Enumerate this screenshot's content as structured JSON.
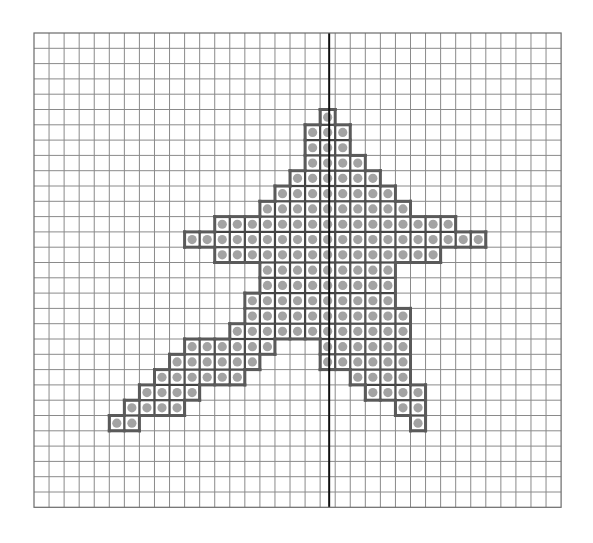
{
  "diagram": {
    "type": "pixel-grid-figure",
    "grid": {
      "columns": 35,
      "rows": 31,
      "origin_x": 34,
      "origin_y": 33,
      "cell_width": 15.06,
      "cell_height": 15.3,
      "line_color": "#8a8a8a",
      "border_color": "#6a6a6a"
    },
    "symmetry_line": {
      "column": 19,
      "position": "center-of-column",
      "color": "#111111",
      "width": 2
    },
    "shape": {
      "outline_color": "#5a5a5a",
      "cell_fill": "#ffffff",
      "dot_color": "#a3a3a3",
      "dot_radius": 4.6,
      "filled_rows": [
        {
          "row": 5,
          "spans": [
            [
              19,
              19
            ]
          ]
        },
        {
          "row": 6,
          "spans": [
            [
              18,
              20
            ]
          ]
        },
        {
          "row": 7,
          "spans": [
            [
              18,
              20
            ]
          ]
        },
        {
          "row": 8,
          "spans": [
            [
              18,
              21
            ]
          ]
        },
        {
          "row": 9,
          "spans": [
            [
              17,
              22
            ]
          ]
        },
        {
          "row": 10,
          "spans": [
            [
              16,
              23
            ]
          ]
        },
        {
          "row": 11,
          "spans": [
            [
              15,
              24
            ]
          ]
        },
        {
          "row": 12,
          "spans": [
            [
              12,
              27
            ]
          ]
        },
        {
          "row": 13,
          "spans": [
            [
              10,
              29
            ]
          ]
        },
        {
          "row": 14,
          "spans": [
            [
              12,
              26
            ]
          ]
        },
        {
          "row": 15,
          "spans": [
            [
              15,
              23
            ]
          ]
        },
        {
          "row": 16,
          "spans": [
            [
              15,
              23
            ]
          ]
        },
        {
          "row": 17,
          "spans": [
            [
              14,
              23
            ]
          ]
        },
        {
          "row": 18,
          "spans": [
            [
              14,
              24
            ]
          ]
        },
        {
          "row": 19,
          "spans": [
            [
              13,
              24
            ]
          ]
        },
        {
          "row": 20,
          "spans": [
            [
              10,
              15
            ],
            [
              19,
              24
            ]
          ]
        },
        {
          "row": 21,
          "spans": [
            [
              9,
              14
            ],
            [
              19,
              24
            ]
          ]
        },
        {
          "row": 22,
          "spans": [
            [
              8,
              13
            ],
            [
              21,
              24
            ]
          ]
        },
        {
          "row": 23,
          "spans": [
            [
              7,
              10
            ],
            [
              22,
              25
            ]
          ]
        },
        {
          "row": 24,
          "spans": [
            [
              6,
              9
            ],
            [
              24,
              25
            ]
          ]
        },
        {
          "row": 25,
          "spans": [
            [
              5,
              6
            ],
            [
              25,
              25
            ]
          ]
        }
      ]
    }
  }
}
